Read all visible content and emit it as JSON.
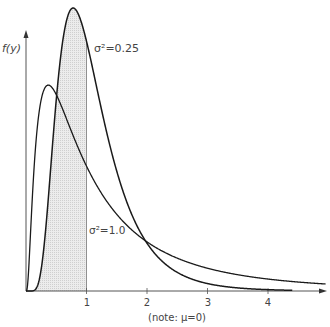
{
  "chart_data": {
    "type": "line",
    "title": "",
    "xlabel": "(note: μ=0)",
    "ylabel": "f(y)",
    "x_ticks": [
      1,
      2,
      3,
      4
    ],
    "xlim": [
      0,
      4.95
    ],
    "ylim": [
      0,
      0.93
    ],
    "grid": false,
    "legend": "inline annotations",
    "distribution": "lognormal",
    "mu": 0,
    "series": [
      {
        "name": "σ²=0.25",
        "sigma2": 0.25,
        "label": "σ²=0.25",
        "mode_x": 0.78,
        "peak_y": 0.9
      },
      {
        "name": "σ²=1.0",
        "sigma2": 1.0,
        "label": "σ²=1.0",
        "mode_x": 0.37,
        "peak_y": 0.66
      }
    ],
    "shaded_region": {
      "series": "σ²=0.25",
      "from_x": 0,
      "to_x": 1
    },
    "vertical_line_x": 1,
    "annotations": [
      {
        "text": "σ²=0.25",
        "x": 1.1,
        "y": 0.72
      },
      {
        "text": "σ²=1.0",
        "x": 1.05,
        "y": 0.2
      }
    ]
  },
  "labels": {
    "ylabel": "f(y)",
    "note": "(note: μ=0)",
    "sigma_025": "σ²=0.25",
    "sigma_10": "σ²=1.0",
    "tick_1": "1",
    "tick_2": "2",
    "tick_3": "3",
    "tick_4": "4"
  },
  "colors": {
    "curve": "#1a1a1a",
    "axis": "#555555",
    "shade": "#e2e2e2",
    "text": "#444444"
  }
}
